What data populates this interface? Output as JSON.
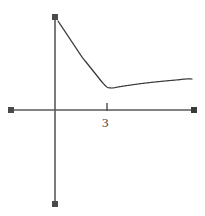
{
  "figure": {
    "width": 205,
    "height": 216,
    "background_color": "#ffffff",
    "axis_color": "#5a5a5a",
    "curve_color": "#3a3a3a"
  },
  "axes": {
    "origin": {
      "x": 55,
      "y": 110
    },
    "x_axis": {
      "name": "horizontal-axis",
      "start": {
        "x": 8,
        "y": 110
      },
      "end": {
        "x": 197,
        "y": 110
      },
      "arrow_left": true,
      "arrow_right": true,
      "label": ""
    },
    "y_axis": {
      "name": "vertical-axis",
      "start": {
        "x": 55,
        "y": 14
      },
      "end": {
        "x": 55,
        "y": 207
      },
      "arrow_top": true,
      "arrow_bottom": true,
      "label": ""
    },
    "ticks": [
      {
        "label": "3",
        "x_pixel": 107,
        "value": 3,
        "axis": "x"
      }
    ]
  },
  "chart_data": {
    "type": "line",
    "title": "",
    "subtitle": "",
    "xlabel": "",
    "ylabel": "",
    "grid": false,
    "legend": null,
    "annotations": [],
    "xtick_labels": [
      "3"
    ],
    "ytick_labels": [],
    "series": [
      {
        "name": "curve",
        "color": "#3a3a3a",
        "x": [
          58,
          62,
          66,
          70,
          74,
          78,
          82,
          86,
          90,
          94,
          98,
          102,
          107,
          112,
          118,
          124,
          131,
          138,
          146,
          155,
          165,
          176,
          186,
          192
        ],
        "y": [
          21,
          27,
          33,
          39,
          45,
          51,
          57,
          62,
          67,
          72,
          77,
          82,
          87,
          88,
          87,
          86,
          85,
          84,
          83,
          82,
          81,
          80,
          79,
          79
        ]
      }
    ]
  }
}
